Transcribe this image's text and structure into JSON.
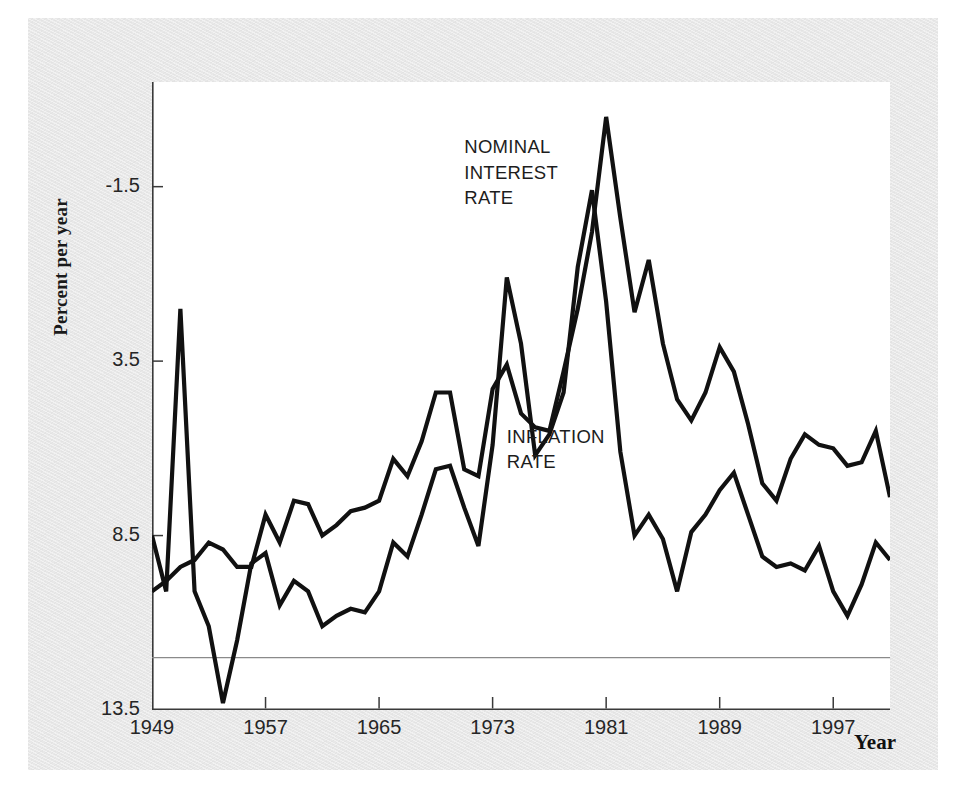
{
  "figure": {
    "background_color": "#e8e8e8",
    "plot_background_color": "#ffffff",
    "line_color": "#111111",
    "zero_line_color": "#8a8a8a"
  },
  "axes": {
    "ylabel": "Percent per year",
    "xlabel": "Year",
    "yticks": [
      "13.5",
      "8.5",
      "3.5",
      "-1.5"
    ],
    "xticks": [
      "1949",
      "1957",
      "1965",
      "1973",
      "1981",
      "1989",
      "1997"
    ]
  },
  "annotations": {
    "nominal": "NOMINAL\nINTEREST\nRATE",
    "inflation": "INFLATION\nRATE"
  },
  "chart_data": {
    "type": "line",
    "title": "",
    "xlabel": "Year",
    "ylabel": "Percent per year",
    "xlim": [
      1949,
      2001
    ],
    "ylim": [
      -1.5,
      16.5
    ],
    "yticks": [
      -1.5,
      3.5,
      8.5,
      13.5
    ],
    "xticks": [
      1949,
      1957,
      1965,
      1973,
      1981,
      1989,
      1997
    ],
    "grid": false,
    "zero_line": 0,
    "legend": "inline-annotations",
    "x": [
      1949,
      1950,
      1951,
      1952,
      1953,
      1954,
      1955,
      1956,
      1957,
      1958,
      1959,
      1960,
      1961,
      1962,
      1963,
      1964,
      1965,
      1966,
      1967,
      1968,
      1969,
      1970,
      1971,
      1972,
      1973,
      1974,
      1975,
      1976,
      1977,
      1978,
      1979,
      1980,
      1981,
      1982,
      1983,
      1984,
      1985,
      1986,
      1987,
      1988,
      1989,
      1990,
      1991,
      1992,
      1993,
      1994,
      1995,
      1996,
      1997,
      1998,
      1999,
      2000,
      2001
    ],
    "series": [
      {
        "name": "NOMINAL INTEREST RATE",
        "values": [
          1.9,
          2.2,
          2.6,
          2.8,
          3.3,
          3.1,
          2.6,
          2.6,
          4.1,
          3.3,
          4.5,
          4.4,
          3.5,
          3.8,
          4.2,
          4.3,
          4.5,
          5.7,
          5.2,
          6.2,
          7.6,
          7.6,
          5.4,
          5.2,
          7.7,
          8.4,
          7.0,
          6.6,
          6.5,
          8.2,
          10.0,
          12.2,
          15.5,
          12.6,
          9.9,
          11.4,
          9.0,
          7.4,
          6.8,
          7.6,
          8.9,
          8.2,
          6.7,
          5.0,
          4.5,
          5.7,
          6.4,
          6.1,
          6.0,
          5.5,
          5.6,
          6.5,
          4.6
        ]
      },
      {
        "name": "INFLATION RATE",
        "values": [
          3.5,
          1.9,
          10.0,
          1.9,
          0.9,
          -1.3,
          0.5,
          2.7,
          3.0,
          1.5,
          2.2,
          1.9,
          0.9,
          1.2,
          1.4,
          1.3,
          1.9,
          3.3,
          2.9,
          4.1,
          5.4,
          5.5,
          4.3,
          3.2,
          6.1,
          10.9,
          9.0,
          5.8,
          6.4,
          7.6,
          11.2,
          13.4,
          10.2,
          5.9,
          3.5,
          4.1,
          3.4,
          1.9,
          3.6,
          4.1,
          4.8,
          5.3,
          4.1,
          2.9,
          2.6,
          2.7,
          2.5,
          3.2,
          1.9,
          1.2,
          2.1,
          3.3,
          2.8
        ]
      }
    ]
  }
}
